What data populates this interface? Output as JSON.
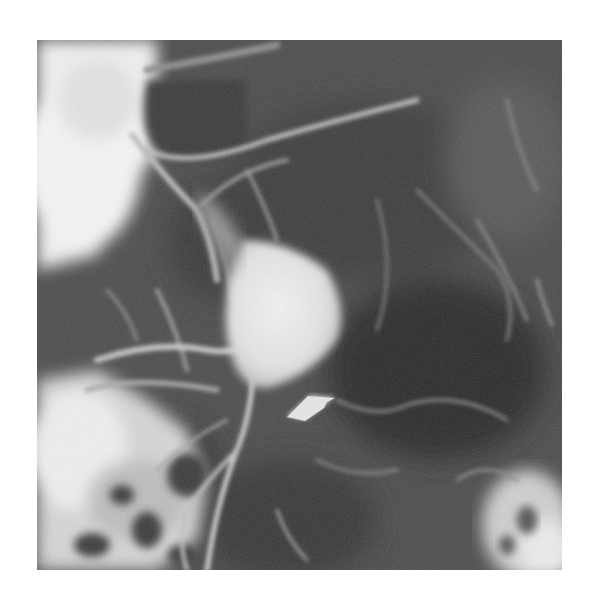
{
  "figure": {
    "type": "radiograph",
    "colors": {
      "background": "#ffffff",
      "film_base": "#4e4e4e",
      "dark_region": "#262626",
      "bright_contrast": "#f2f2f2",
      "arrow": "#e6e6e6"
    },
    "annotation": {
      "icon": "arrow-icon",
      "direction": "up-left",
      "target": "lower margin of bright rounded mass"
    }
  }
}
